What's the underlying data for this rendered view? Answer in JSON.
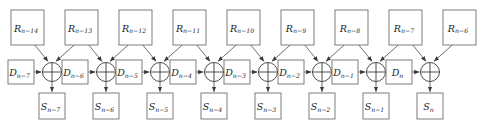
{
  "diagram": {
    "type": "signal-flow-diagram",
    "colors": {
      "background": "#ffffff",
      "box_stroke": "#6f6f6f",
      "edge_stroke": "#4a4a4a",
      "xor_stroke": "#3a3a3a",
      "label_fill": "#1c1c1c"
    },
    "rows": {
      "top_row_name": "R",
      "middle_row_name": "D",
      "bottom_row_name": "S",
      "operator_name": "xor"
    },
    "top_row": [
      {
        "base": "R",
        "sub": "n−14",
        "label": "R n−14"
      },
      {
        "base": "R",
        "sub": "n−13",
        "label": "R n−13"
      },
      {
        "base": "R",
        "sub": "n−12",
        "label": "R n−12"
      },
      {
        "base": "R",
        "sub": "n−11",
        "label": "R n−11"
      },
      {
        "base": "R",
        "sub": "n−10",
        "label": "R n−10"
      },
      {
        "base": "R",
        "sub": "n−9",
        "label": "R n−9"
      },
      {
        "base": "R",
        "sub": "n−8",
        "label": "R n−8"
      },
      {
        "base": "R",
        "sub": "n−7",
        "label": "R n−7"
      },
      {
        "base": "R",
        "sub": "n−6",
        "label": "R n−6"
      }
    ],
    "middle_row": [
      {
        "base": "D",
        "sub": "n−7",
        "label": "D n−7"
      },
      {
        "base": "D",
        "sub": "n−6",
        "label": "D n−6"
      },
      {
        "base": "D",
        "sub": "n−5",
        "label": "D n−5"
      },
      {
        "base": "D",
        "sub": "n−4",
        "label": "D n−4"
      },
      {
        "base": "D",
        "sub": "n−3",
        "label": "D n−3"
      },
      {
        "base": "D",
        "sub": "n−2",
        "label": "D n−2"
      },
      {
        "base": "D",
        "sub": "n−1",
        "label": "D n−1"
      },
      {
        "base": "D",
        "sub": "n",
        "label": "D n"
      }
    ],
    "bottom_row": [
      {
        "base": "S",
        "sub": "n−7",
        "label": "S n−7"
      },
      {
        "base": "S",
        "sub": "n−6",
        "label": "S n−6"
      },
      {
        "base": "S",
        "sub": "n−5",
        "label": "S n−5"
      },
      {
        "base": "S",
        "sub": "n−4",
        "label": "S n−4"
      },
      {
        "base": "S",
        "sub": "n−3",
        "label": "S n−3"
      },
      {
        "base": "S",
        "sub": "n−2",
        "label": "S n−2"
      },
      {
        "base": "S",
        "sub": "n−1",
        "label": "S n−1"
      },
      {
        "base": "S",
        "sub": "n",
        "label": "S n"
      }
    ],
    "operators": [
      {
        "symbol": "⊕",
        "name": "xor-1"
      },
      {
        "symbol": "⊕",
        "name": "xor-2"
      },
      {
        "symbol": "⊕",
        "name": "xor-3"
      },
      {
        "symbol": "⊕",
        "name": "xor-4"
      },
      {
        "symbol": "⊕",
        "name": "xor-5"
      },
      {
        "symbol": "⊕",
        "name": "xor-6"
      },
      {
        "symbol": "⊕",
        "name": "xor-7"
      },
      {
        "symbol": "⊕",
        "name": "xor-8"
      }
    ],
    "geometry": {
      "r_box_w": 33,
      "r_box_h": 35,
      "r_box_y": 10,
      "r_first_x": 11,
      "r_step": 54,
      "d_box_w": 26,
      "d_box_h": 24,
      "d_box_y": 60,
      "d_first_x": 8,
      "d_step": 54,
      "s_box_w": 26,
      "s_box_h": 26,
      "s_box_y": 93,
      "s_first_x": 39,
      "s_step": 54,
      "xor_cx_first": 52,
      "xor_cy": 72,
      "xor_r": 9.5,
      "xor_step": 54
    }
  }
}
